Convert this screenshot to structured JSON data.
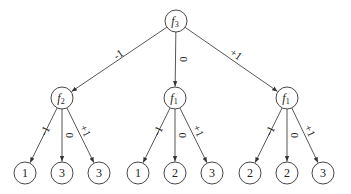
{
  "diagram": {
    "type": "decision-tree",
    "root": {
      "id": "n0",
      "func": "f",
      "sub": "3",
      "x": 176,
      "y": 21
    },
    "level1": [
      {
        "id": "n1",
        "func": "f",
        "sub": "2",
        "x": 62,
        "y": 98,
        "edge_label": "-1"
      },
      {
        "id": "n2",
        "func": "f",
        "sub": "1",
        "x": 175,
        "y": 98,
        "edge_label": "0"
      },
      {
        "id": "n3",
        "func": "f",
        "sub": "1",
        "x": 287,
        "y": 98,
        "edge_label": "+1"
      }
    ],
    "leaves": [
      {
        "parent": 0,
        "value": "1",
        "x": 25,
        "y": 173,
        "edge_label": "-1"
      },
      {
        "parent": 0,
        "value": "3",
        "x": 62,
        "y": 173,
        "edge_label": "0"
      },
      {
        "parent": 0,
        "value": "3",
        "x": 99,
        "y": 173,
        "edge_label": "+1"
      },
      {
        "parent": 1,
        "value": "1",
        "x": 138,
        "y": 173,
        "edge_label": "-1"
      },
      {
        "parent": 1,
        "value": "2",
        "x": 175,
        "y": 173,
        "edge_label": "0"
      },
      {
        "parent": 1,
        "value": "3",
        "x": 212,
        "y": 173,
        "edge_label": "+1"
      },
      {
        "parent": 2,
        "value": "2",
        "x": 250,
        "y": 173,
        "edge_label": "-1"
      },
      {
        "parent": 2,
        "value": "2",
        "x": 287,
        "y": 173,
        "edge_label": "0"
      },
      {
        "parent": 2,
        "value": "3",
        "x": 323,
        "y": 173,
        "edge_label": "+1"
      }
    ],
    "node_radius": 11,
    "colors": {
      "stroke": "#333333",
      "text": "#222222",
      "background": "#ffffff"
    }
  }
}
